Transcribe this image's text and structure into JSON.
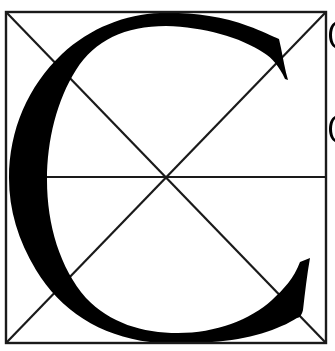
{
  "diagram": {
    "title": "Construction of the capital letter C",
    "letter": "C",
    "colors": {
      "background": "#ffffff",
      "ink": "#000000",
      "grid_line": "#1a1a1a"
    },
    "square": {
      "x1": 6,
      "y1": 12,
      "x2": 326,
      "y2": 343
    },
    "center": {
      "x": 166,
      "y": 177
    },
    "guides": [
      "square-border",
      "diagonal-top-left-to-bottom-right",
      "diagonal-bottom-left-to-top-right",
      "horizontal-midline"
    ],
    "right_edge_fragments": [
      "(",
      "("
    ]
  }
}
